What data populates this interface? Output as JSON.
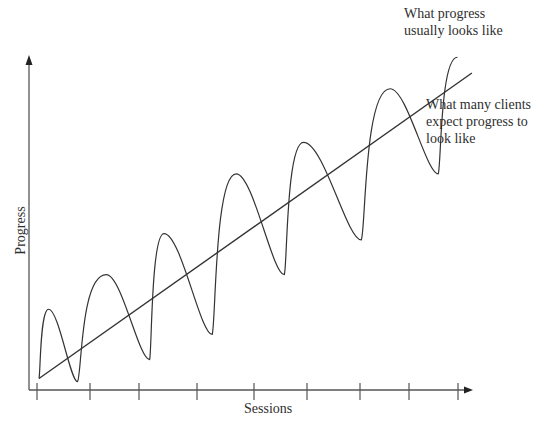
{
  "chart_data": {
    "type": "line",
    "title": "",
    "xlabel": "Sessions",
    "ylabel": "Progress",
    "x_tick_count": 9,
    "x_tick_labels": [],
    "y_tick_labels": [],
    "grid": false,
    "series": [
      {
        "name": "What progress usually looks like",
        "style": "oscillating curve",
        "points": [
          {
            "x": 0.0,
            "y": 0.03
          },
          {
            "x": 0.1,
            "y": 0.25
          },
          {
            "x": 0.4,
            "y": 0.02
          },
          {
            "x": 0.7,
            "y": 0.36
          },
          {
            "x": 1.15,
            "y": 0.09
          },
          {
            "x": 1.3,
            "y": 0.49
          },
          {
            "x": 1.8,
            "y": 0.17
          },
          {
            "x": 2.05,
            "y": 0.68
          },
          {
            "x": 2.55,
            "y": 0.36
          },
          {
            "x": 2.75,
            "y": 0.78
          },
          {
            "x": 3.35,
            "y": 0.47
          },
          {
            "x": 3.65,
            "y": 0.95
          },
          {
            "x": 4.15,
            "y": 0.68
          },
          {
            "x": 4.35,
            "y": 1.05
          }
        ]
      },
      {
        "name": "What many clients expect progress to look like",
        "style": "straight line",
        "points": [
          {
            "x": 0.0,
            "y": 0.03
          },
          {
            "x": 4.5,
            "y": 1.0
          }
        ]
      }
    ],
    "annotations": [
      {
        "text": [
          "What progress",
          "usually looks like"
        ],
        "target": "oscillating curve"
      },
      {
        "text": [
          "What many clients",
          "expect progress to",
          "look like"
        ],
        "target": "straight line"
      }
    ]
  }
}
